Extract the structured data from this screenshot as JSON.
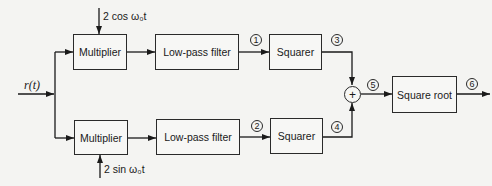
{
  "diagram": {
    "input": {
      "label": "r(t)"
    },
    "top_branch": {
      "reference_signal": "2 cos ω₀t",
      "multiplier": "Multiplier",
      "filter": "Low-pass filter",
      "squarer": "Squarer",
      "node_after_filter": "1",
      "node_after_squarer": "3"
    },
    "bottom_branch": {
      "reference_signal": "2 sin ω₀t",
      "multiplier": "Multiplier",
      "filter": "Low-pass filter",
      "squarer": "Squarer",
      "node_after_filter": "2",
      "node_after_squarer": "4"
    },
    "summer": {
      "symbol": "+"
    },
    "node_after_sum": "5",
    "square_root": "Square root",
    "node_output": "6"
  }
}
